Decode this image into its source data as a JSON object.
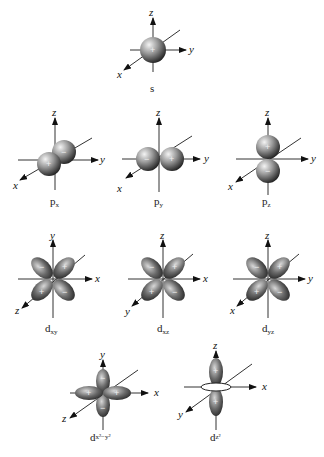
{
  "figure": {
    "orbitals": [
      {
        "id": "s",
        "label": "s",
        "axes": [
          "z",
          "y",
          "x"
        ],
        "signs": [
          "+"
        ]
      },
      {
        "id": "px",
        "label": "p",
        "sub": "x",
        "axes": [
          "z",
          "y",
          "x"
        ],
        "signs": [
          "+",
          "−"
        ]
      },
      {
        "id": "py",
        "label": "p",
        "sub": "y",
        "axes": [
          "z",
          "y",
          "x"
        ],
        "signs": [
          "−",
          "+"
        ]
      },
      {
        "id": "pz",
        "label": "p",
        "sub": "z",
        "axes": [
          "z",
          "y",
          "x"
        ],
        "signs": [
          "+",
          "−"
        ]
      },
      {
        "id": "dxy",
        "label": "d",
        "sub": "xy",
        "axes": [
          "y",
          "x",
          "z"
        ],
        "signs": [
          "−",
          "+",
          "+",
          "−"
        ]
      },
      {
        "id": "dxz",
        "label": "d",
        "sub": "xz",
        "axes": [
          "z",
          "x",
          "y"
        ],
        "signs": [
          "−",
          "+",
          "+",
          "−"
        ]
      },
      {
        "id": "dyz",
        "label": "d",
        "sub": "yz",
        "axes": [
          "z",
          "y",
          "x"
        ],
        "signs": [
          "−",
          "+",
          "+",
          "−"
        ]
      },
      {
        "id": "dx2y2",
        "label": "d",
        "sub": "x²−y²",
        "axes": [
          "y",
          "x",
          "z"
        ],
        "signs": [
          "−",
          "+",
          "+",
          "−"
        ]
      },
      {
        "id": "dz2",
        "label": "d",
        "sub": "z²",
        "axes": [
          "z",
          "x",
          "y"
        ],
        "signs": [
          "+",
          "+"
        ]
      }
    ]
  }
}
